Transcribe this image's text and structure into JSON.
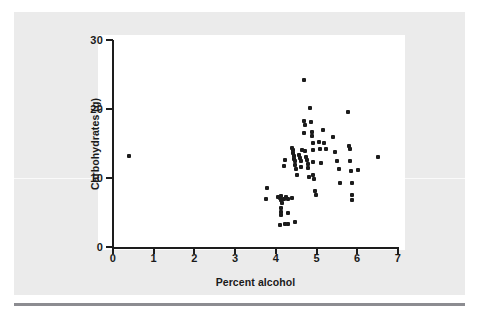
{
  "figure": {
    "background_color": "#ebebeb",
    "canvas_color": "#ffffff",
    "axis_color": "#1d1d1d",
    "point_color": "#1c1c1c",
    "rule_color": "#8c8c91"
  },
  "chart_data": {
    "type": "scatter",
    "title": "",
    "xlabel": "Percent alcohol",
    "ylabel": "Carbohydrates (g)",
    "xlim": [
      0,
      7
    ],
    "ylim": [
      0,
      30
    ],
    "xticks": [
      0,
      1,
      2,
      3,
      4,
      5,
      6,
      7
    ],
    "xtick_labels": [
      "0",
      "1",
      "2",
      "3",
      "4",
      "5",
      "6",
      "7"
    ],
    "yticks": [
      0,
      10,
      20,
      30
    ],
    "ytick_labels": [
      "0",
      "10",
      "20",
      "30"
    ],
    "grid": false,
    "legend": false,
    "marker": "square-dot",
    "points": [
      [
        0.4,
        13.2
      ],
      [
        3.78,
        8.5
      ],
      [
        3.75,
        6.9
      ],
      [
        4.05,
        7.3
      ],
      [
        4.1,
        7.1
      ],
      [
        4.12,
        6.8
      ],
      [
        4.12,
        7.4
      ],
      [
        4.14,
        6.4
      ],
      [
        4.2,
        7.0
      ],
      [
        4.25,
        7.2
      ],
      [
        4.3,
        6.9
      ],
      [
        4.4,
        7.1
      ],
      [
        4.12,
        5.6
      ],
      [
        4.12,
        5.1
      ],
      [
        4.12,
        4.7
      ],
      [
        4.3,
        5.0
      ],
      [
        4.1,
        3.2
      ],
      [
        4.22,
        3.4
      ],
      [
        4.3,
        3.4
      ],
      [
        4.48,
        3.6
      ],
      [
        4.2,
        11.8
      ],
      [
        4.22,
        12.6
      ],
      [
        4.4,
        14.4
      ],
      [
        4.42,
        14.1
      ],
      [
        4.42,
        13.6
      ],
      [
        4.44,
        13.2
      ],
      [
        4.45,
        12.8
      ],
      [
        4.46,
        12.4
      ],
      [
        4.48,
        11.9
      ],
      [
        4.5,
        11.3
      ],
      [
        4.52,
        10.4
      ],
      [
        4.58,
        13.4
      ],
      [
        4.6,
        12.9
      ],
      [
        4.62,
        12.5
      ],
      [
        4.62,
        11.6
      ],
      [
        4.65,
        14.1
      ],
      [
        4.7,
        24.2
      ],
      [
        4.68,
        16.5
      ],
      [
        4.7,
        18.2
      ],
      [
        4.72,
        17.7
      ],
      [
        4.72,
        13.9
      ],
      [
        4.74,
        13.1
      ],
      [
        4.76,
        12.6
      ],
      [
        4.78,
        12.1
      ],
      [
        4.8,
        11.4
      ],
      [
        4.82,
        10.1
      ],
      [
        4.85,
        20.1
      ],
      [
        4.86,
        18.1
      ],
      [
        4.88,
        16.6
      ],
      [
        4.88,
        16.1
      ],
      [
        4.9,
        15.1
      ],
      [
        4.9,
        14.0
      ],
      [
        4.92,
        12.3
      ],
      [
        4.92,
        10.4
      ],
      [
        4.94,
        9.8
      ],
      [
        4.96,
        8.1
      ],
      [
        4.98,
        7.5
      ],
      [
        5.05,
        15.2
      ],
      [
        5.08,
        14.2
      ],
      [
        5.1,
        12.2
      ],
      [
        5.15,
        17.0
      ],
      [
        5.18,
        15.1
      ],
      [
        5.22,
        14.2
      ],
      [
        5.4,
        16.0
      ],
      [
        5.45,
        13.8
      ],
      [
        5.5,
        12.4
      ],
      [
        5.55,
        11.3
      ],
      [
        5.58,
        9.3
      ],
      [
        5.78,
        19.6
      ],
      [
        5.8,
        14.6
      ],
      [
        5.82,
        14.2
      ],
      [
        5.82,
        12.5
      ],
      [
        5.84,
        11.0
      ],
      [
        5.86,
        9.3
      ],
      [
        5.86,
        7.5
      ],
      [
        5.88,
        6.8
      ],
      [
        6.02,
        11.2
      ],
      [
        6.5,
        13.0
      ]
    ]
  }
}
